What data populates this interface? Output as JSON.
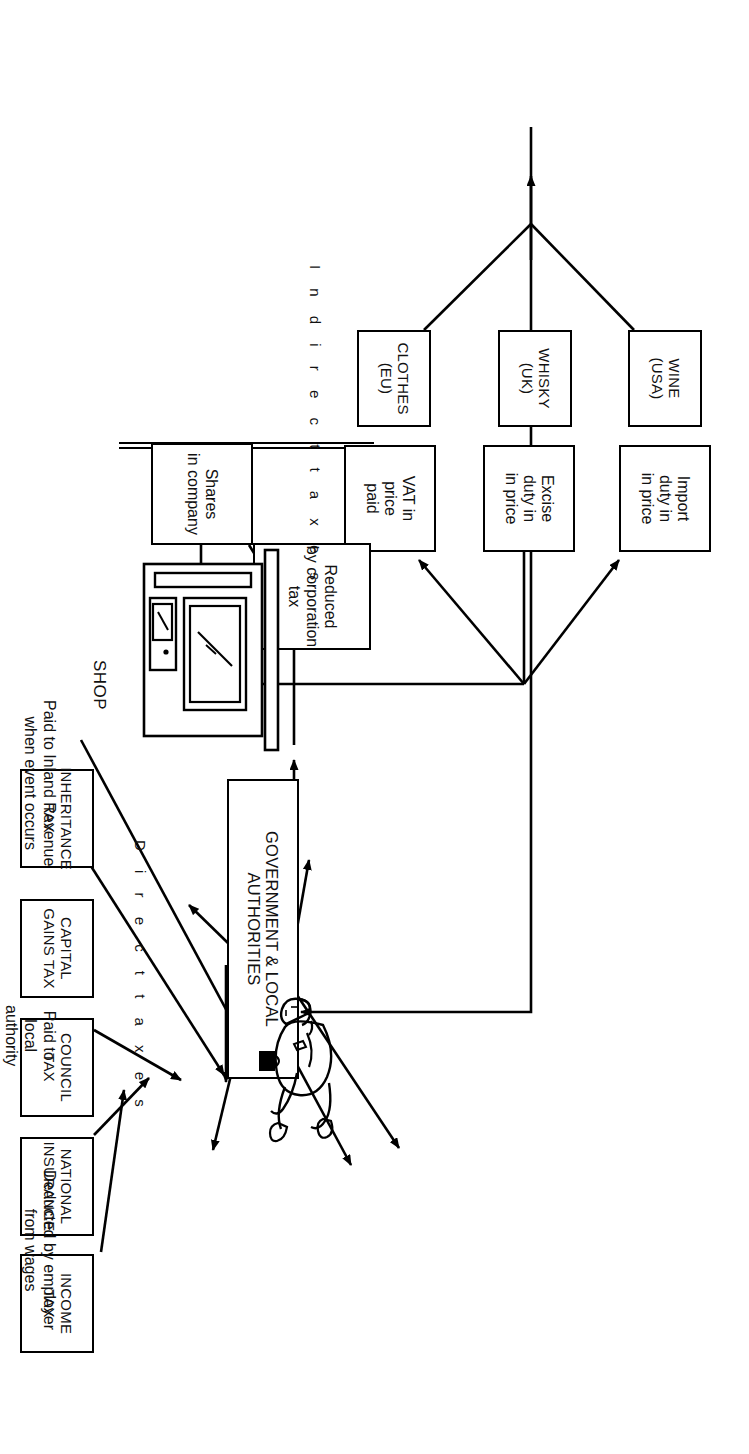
{
  "diagram": {
    "orientation": "rotated-90",
    "section_labels": {
      "indirect": "I n d i r e c t   t a x e s",
      "direct": "D i r e c t   t a x e s"
    },
    "hub": {
      "label_line1": "GOVERNMENT & LOCAL",
      "label_line2": "AUTHORITIES"
    },
    "indirect_goods": [
      {
        "id": "clothes",
        "line1": "CLOTHES",
        "line2": "(EU)"
      },
      {
        "id": "whisky",
        "line1": "WHISKY",
        "line2": "(UK)"
      },
      {
        "id": "wine",
        "line1": "WINE",
        "line2": "(USA)"
      }
    ],
    "indirect_charges": [
      {
        "id": "vat",
        "line1": "VAT in",
        "line2": "price",
        "line3": "paid"
      },
      {
        "id": "excise",
        "line1": "Excise",
        "line2": "duty in",
        "line3": "in price"
      },
      {
        "id": "import",
        "line1": "Import",
        "line2": "duty in",
        "line3": "in price"
      }
    ],
    "direct_taxes": [
      {
        "id": "income-tax",
        "line1": "INCOME",
        "line2": "TAX"
      },
      {
        "id": "national-insurance",
        "line1": "NATIONAL",
        "line2": "INSURANCE"
      },
      {
        "id": "council-tax",
        "line1": "COUNCIL",
        "line2": "TAX"
      },
      {
        "id": "capital-gains-tax",
        "line1": "CAPITAL",
        "line2": "GAINS TAX"
      },
      {
        "id": "inheritance-tax",
        "line1": "INHERITANCE",
        "line2": "TAX"
      }
    ],
    "shares": {
      "line1": "Shares",
      "line2": "in company"
    },
    "dividend": {
      "line1": "Dividend",
      "line2": "tax"
    },
    "corporation": {
      "line1": "Reduced",
      "line2": "by corporation",
      "line3": "tax"
    },
    "notes": [
      {
        "id": "deducted",
        "line1": "Deducted by employer",
        "line2": "from wages"
      },
      {
        "id": "local",
        "line1": "Paid to",
        "line2": "local",
        "line3": "authority"
      },
      {
        "id": "inland",
        "line1": "Paid to Inland Revenue",
        "line2": "when event occurs"
      }
    ],
    "shop": {
      "label": "SHOP"
    },
    "colors": {
      "ink": "#000000",
      "paper": "#ffffff"
    }
  }
}
